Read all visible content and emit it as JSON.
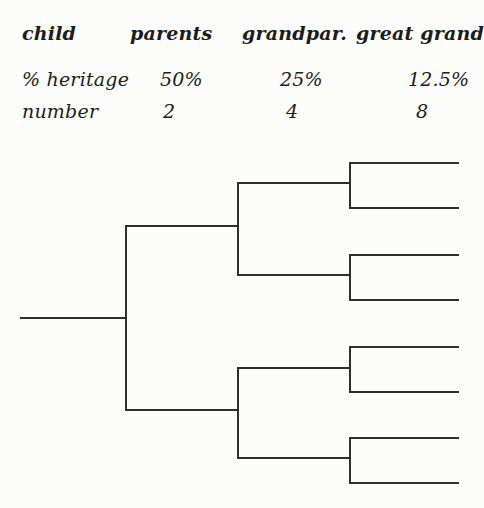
{
  "table": {
    "headers": [
      "child",
      "parents",
      "grandpar.",
      "great grand"
    ],
    "rows": [
      {
        "label": "% heritage",
        "values": [
          "50%",
          "25%",
          "12.5%"
        ]
      },
      {
        "label": "number",
        "values": [
          "2",
          "4",
          "8"
        ]
      }
    ]
  },
  "tree": {
    "line_color": "#2e2e2e",
    "line_thickness": 2,
    "generations": [
      "child",
      "parents",
      "grandparents",
      "great-grandparents"
    ],
    "counts_per_generation": [
      1,
      2,
      4,
      8
    ],
    "segments": [
      {
        "name": "child-line",
        "x1": 21,
        "y1": 318,
        "x2": 126,
        "y2": 318
      },
      {
        "name": "parents-bracket-vertical",
        "x1": 126,
        "y1": 226,
        "x2": 126,
        "y2": 410
      },
      {
        "name": "parent-top-line",
        "x1": 126,
        "y1": 226,
        "x2": 238,
        "y2": 226
      },
      {
        "name": "parent-bottom-line",
        "x1": 126,
        "y1": 410,
        "x2": 238,
        "y2": 410
      },
      {
        "name": "grandparents-top-bracket-vertical",
        "x1": 238,
        "y1": 183,
        "x2": 238,
        "y2": 275
      },
      {
        "name": "grandparent-line-1",
        "x1": 238,
        "y1": 183,
        "x2": 350,
        "y2": 183
      },
      {
        "name": "grandparent-line-2",
        "x1": 238,
        "y1": 275,
        "x2": 350,
        "y2": 275
      },
      {
        "name": "grandparents-bottom-bracket-vertical",
        "x1": 238,
        "y1": 368,
        "x2": 238,
        "y2": 458
      },
      {
        "name": "grandparent-line-3",
        "x1": 238,
        "y1": 368,
        "x2": 350,
        "y2": 368
      },
      {
        "name": "grandparent-line-4",
        "x1": 238,
        "y1": 458,
        "x2": 350,
        "y2": 458
      },
      {
        "name": "greatgrand-bracket-1-vertical",
        "x1": 350,
        "y1": 163,
        "x2": 350,
        "y2": 208
      },
      {
        "name": "greatgrand-line-1",
        "x1": 350,
        "y1": 163,
        "x2": 458,
        "y2": 163
      },
      {
        "name": "greatgrand-line-2",
        "x1": 350,
        "y1": 208,
        "x2": 458,
        "y2": 208
      },
      {
        "name": "greatgrand-bracket-2-vertical",
        "x1": 350,
        "y1": 255,
        "x2": 350,
        "y2": 300
      },
      {
        "name": "greatgrand-line-3",
        "x1": 350,
        "y1": 255,
        "x2": 458,
        "y2": 255
      },
      {
        "name": "greatgrand-line-4",
        "x1": 350,
        "y1": 300,
        "x2": 458,
        "y2": 300
      },
      {
        "name": "greatgrand-bracket-3-vertical",
        "x1": 350,
        "y1": 347,
        "x2": 350,
        "y2": 392
      },
      {
        "name": "greatgrand-line-5",
        "x1": 350,
        "y1": 347,
        "x2": 458,
        "y2": 347
      },
      {
        "name": "greatgrand-line-6",
        "x1": 350,
        "y1": 392,
        "x2": 458,
        "y2": 392
      },
      {
        "name": "greatgrand-bracket-4-vertical",
        "x1": 350,
        "y1": 438,
        "x2": 350,
        "y2": 483
      },
      {
        "name": "greatgrand-line-7",
        "x1": 350,
        "y1": 438,
        "x2": 458,
        "y2": 438
      },
      {
        "name": "greatgrand-line-8",
        "x1": 350,
        "y1": 483,
        "x2": 458,
        "y2": 483
      }
    ]
  }
}
